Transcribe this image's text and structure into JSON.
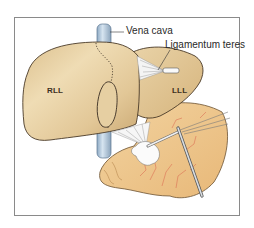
{
  "figure": {
    "labels": {
      "vena_cava": "Vena cava",
      "ligamentum_teres": "Ligamentum teres",
      "rll": "RLL",
      "lll": "LLL"
    },
    "colors": {
      "liver": "#e2c797",
      "liver_shadow": "#c9a86f",
      "liver_highlight": "#f3e4c4",
      "vena_cava": "#b9cfe3",
      "stomach": "#f0c890",
      "vessels": "#d9604a",
      "outline": "#4a3a28",
      "frame": "#8a8a8a"
    }
  }
}
